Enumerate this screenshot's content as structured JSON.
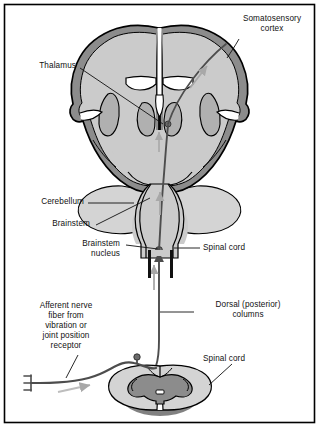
{
  "figure": {
    "title_visible": false,
    "type": "anatomical-diagram",
    "border_color": "#000000",
    "background_color": "#ffffff"
  },
  "colors": {
    "cortex_ribbon": "#8c8c8c",
    "brain_fill": "#cbcbcb",
    "deep_gray": "#b0b0b0",
    "outline": "#000000",
    "tract": "#4d4d4d",
    "arrow_gray": "#a8a8a8",
    "white_matter": "#d4d4d4",
    "ventricle": "#ffffff",
    "text": "#111111"
  },
  "labels": {
    "somatosensory_cortex": "Somatosensory\ncortex",
    "thalamus": "Thalamus",
    "cerebellum": "Cerebellum",
    "brainstem": "Brainstem",
    "brainstem_nucleus": "Brainstem\nnucleus",
    "spinal_cord_upper": "Spinal cord",
    "dorsal_columns": "Dorsal (posterior)\ncolumns",
    "afferent_fiber": "Afferent nerve\nfiber from\nvibration or\njoint position\nreceptor",
    "spinal_cord_lower": "Spinal cord"
  },
  "structures": [
    {
      "name": "cerebral-hemispheres",
      "note": "coronal section, paired hemispheres with gyri"
    },
    {
      "name": "cortex-ribbon",
      "note": "dark gray outer cortical band"
    },
    {
      "name": "lateral-ventricles",
      "note": "white slit-shaped cavities"
    },
    {
      "name": "third-ventricle",
      "note": "narrow midline white cavity"
    },
    {
      "name": "thalamus",
      "note": "paired deep gray nuclei flanking third ventricle"
    },
    {
      "name": "basal-ganglia",
      "note": "paired comma-shaped deep gray masses laterally"
    },
    {
      "name": "brainstem",
      "note": "midline column descending from diencephalon"
    },
    {
      "name": "cerebellum",
      "note": "paired lobes lateral to brainstem"
    },
    {
      "name": "brainstem-nucleus",
      "note": "small dark node at lower brainstem"
    },
    {
      "name": "ascending-tract",
      "note": "dark line ascending from spinal cord, crossing to contralateral thalamus and cortex"
    },
    {
      "name": "spinal-cord-cross-section",
      "note": "oval with butterfly-shaped central gray matter"
    },
    {
      "name": "afferent-nerve-fiber",
      "note": "peripheral fiber with receptor endings and dorsal root ganglion"
    },
    {
      "name": "receptor-endings",
      "note": "comb/fork shaped terminal at far left"
    },
    {
      "name": "direction-arrows",
      "note": "light gray arrows showing afferent/ascending direction"
    }
  ]
}
